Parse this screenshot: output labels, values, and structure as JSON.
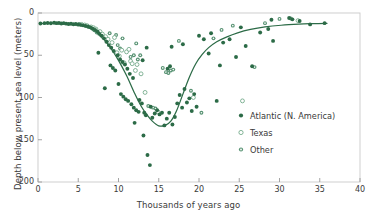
{
  "chart_data": {
    "type": "scatter",
    "title": "",
    "xlabel": "Thousands of years ago",
    "ylabel": "Depth below present sea level (meters)",
    "xlim": [
      0,
      40
    ],
    "ylim": [
      200,
      0
    ],
    "y_inverted": true,
    "grid": false,
    "legend_position": "center-right",
    "xticks": [
      0,
      5,
      10,
      15,
      20,
      25,
      30,
      35,
      40
    ],
    "xtick_labels": [
      "0",
      "5",
      "10",
      "15",
      "20",
      "25",
      "30",
      "35",
      "40"
    ],
    "yticks": [
      0,
      50,
      100,
      150,
      200
    ],
    "ytick_labels": [
      "0",
      "50",
      "100",
      "150",
      "200"
    ],
    "series": [
      {
        "name": "Atlantic (N. America)",
        "marker": "filled-circle",
        "color": "#2c6b47",
        "points": [
          [
            0.3,
            12.5
          ],
          [
            0.8,
            12.0
          ],
          [
            1.2,
            11.8
          ],
          [
            1.6,
            12.2
          ],
          [
            2.0,
            11.5
          ],
          [
            2.3,
            12.0
          ],
          [
            2.6,
            11.8
          ],
          [
            2.9,
            12.4
          ],
          [
            3.2,
            12.0
          ],
          [
            3.5,
            12.6
          ],
          [
            3.8,
            13.0
          ],
          [
            4.1,
            12.8
          ],
          [
            4.4,
            13.4
          ],
          [
            4.7,
            13.0
          ],
          [
            5.0,
            13.8
          ],
          [
            5.3,
            14.0
          ],
          [
            5.6,
            14.6
          ],
          [
            5.9,
            15.2
          ],
          [
            6.2,
            16.0
          ],
          [
            6.5,
            17.0
          ],
          [
            6.8,
            18.5
          ],
          [
            7.1,
            20.0
          ],
          [
            7.4,
            22.0
          ],
          [
            7.6,
            24.5
          ],
          [
            7.9,
            27.0
          ],
          [
            7.5,
            47.0
          ],
          [
            8.2,
            30.0
          ],
          [
            8.5,
            34.0
          ],
          [
            8.3,
            89.0
          ],
          [
            8.8,
            38.0
          ],
          [
            9.1,
            41.0
          ],
          [
            9.4,
            45.0
          ],
          [
            9.0,
            62.0
          ],
          [
            9.3,
            65.0
          ],
          [
            9.6,
            68.0
          ],
          [
            9.9,
            50.0
          ],
          [
            10.2,
            55.0
          ],
          [
            10.5,
            58.0
          ],
          [
            10.0,
            84.0
          ],
          [
            10.3,
            96.0
          ],
          [
            10.6,
            99.0
          ],
          [
            10.9,
            102.0
          ],
          [
            11.2,
            104.0
          ],
          [
            10.8,
            61.0
          ],
          [
            11.1,
            66.0
          ],
          [
            11.4,
            72.0
          ],
          [
            11.6,
            108.0
          ],
          [
            11.9,
            112.0
          ],
          [
            12.2,
            115.0
          ],
          [
            12.5,
            117.0
          ],
          [
            11.8,
            77.0
          ],
          [
            12.0,
            130.0
          ],
          [
            12.6,
            103.0
          ],
          [
            12.9,
            107.0
          ],
          [
            13.2,
            118.0
          ],
          [
            13.4,
            121.0
          ],
          [
            13.1,
            145.0
          ],
          [
            13.6,
            168.0
          ],
          [
            13.9,
            180.0
          ],
          [
            13.0,
            56.0
          ],
          [
            13.5,
            41.0
          ],
          [
            14.2,
            124.0
          ],
          [
            14.5,
            119.0
          ],
          [
            14.8,
            115.0
          ],
          [
            15.1,
            120.0
          ],
          [
            15.4,
            118.0
          ],
          [
            14.0,
            111.0
          ],
          [
            15.7,
            133.0
          ],
          [
            16.0,
            125.0
          ],
          [
            16.3,
            118.0
          ],
          [
            16.1,
            66.0
          ],
          [
            16.4,
            63.0
          ],
          [
            16.7,
            132.0
          ],
          [
            17.0,
            123.0
          ],
          [
            16.6,
            40.0
          ],
          [
            17.3,
            107.0
          ],
          [
            17.6,
            97.0
          ],
          [
            17.9,
            112.0
          ],
          [
            18.2,
            90.0
          ],
          [
            18.5,
            106.0
          ],
          [
            18.0,
            37.0
          ],
          [
            18.8,
            101.0
          ],
          [
            19.1,
            116.0
          ],
          [
            19.4,
            96.0
          ],
          [
            19.7,
            111.0
          ],
          [
            20.0,
            27.0
          ],
          [
            20.6,
            31.0
          ],
          [
            21.2,
            48.0
          ],
          [
            21.5,
            24.0
          ],
          [
            22.2,
            104.0
          ],
          [
            22.6,
            62.0
          ],
          [
            23.0,
            35.0
          ],
          [
            23.8,
            31.0
          ],
          [
            24.6,
            52.0
          ],
          [
            25.2,
            17.0
          ],
          [
            25.8,
            39.0
          ],
          [
            26.6,
            63.0
          ],
          [
            27.6,
            23.0
          ],
          [
            28.6,
            19.0
          ],
          [
            29.2,
            33.0
          ],
          [
            29.0,
            8.0
          ],
          [
            31.2,
            6.0
          ],
          [
            31.6,
            7.5
          ],
          [
            32.5,
            9.5
          ],
          [
            33.8,
            13.5
          ],
          [
            35.6,
            12.0
          ]
        ]
      },
      {
        "name": "Texas",
        "marker": "open-circle",
        "color": "#6fa886",
        "points": [
          [
            5.4,
            13.5
          ],
          [
            5.8,
            14.2
          ],
          [
            6.1,
            15.0
          ],
          [
            6.6,
            16.5
          ],
          [
            6.9,
            17.5
          ],
          [
            7.2,
            19.0
          ],
          [
            7.7,
            22.0
          ],
          [
            8.0,
            25.0
          ],
          [
            8.4,
            28.0
          ],
          [
            8.7,
            31.0
          ],
          [
            9.2,
            35.0
          ],
          [
            9.5,
            29.0
          ],
          [
            9.8,
            47.0
          ],
          [
            10.1,
            51.0
          ],
          [
            10.4,
            44.0
          ],
          [
            10.7,
            59.0
          ],
          [
            11.0,
            46.0
          ],
          [
            11.3,
            43.0
          ],
          [
            11.5,
            57.0
          ],
          [
            11.7,
            60.0
          ],
          [
            12.1,
            68.0
          ],
          [
            12.3,
            61.0
          ],
          [
            12.8,
            72.0
          ],
          [
            13.3,
            94.0
          ],
          [
            14.9,
            117.0
          ],
          [
            19.3,
            100.0
          ],
          [
            25.4,
            104.0
          ],
          [
            32.3,
            9.0
          ]
        ]
      },
      {
        "name": "Other",
        "marker": "dotted-circle",
        "color": "#4e8c6a",
        "points": [
          [
            5.1,
            13.0
          ],
          [
            5.5,
            13.8
          ],
          [
            6.0,
            15.5
          ],
          [
            6.3,
            16.2
          ],
          [
            6.7,
            18.0
          ],
          [
            7.0,
            20.5
          ],
          [
            7.3,
            23.0
          ],
          [
            7.8,
            26.0
          ],
          [
            8.1,
            29.0
          ],
          [
            8.6,
            33.0
          ],
          [
            8.9,
            24.0
          ],
          [
            9.7,
            26.0
          ],
          [
            10.5,
            30.0
          ],
          [
            9.9,
            38.0
          ],
          [
            10.2,
            42.0
          ],
          [
            11.5,
            52.0
          ],
          [
            11.9,
            50.0
          ],
          [
            12.4,
            55.0
          ],
          [
            12.7,
            50.0
          ],
          [
            12.2,
            36.0
          ],
          [
            13.7,
            110.0
          ],
          [
            14.3,
            112.0
          ],
          [
            14.6,
            113.0
          ],
          [
            15.9,
            70.0
          ],
          [
            16.2,
            71.0
          ],
          [
            16.5,
            68.0
          ],
          [
            15.5,
            65.0
          ],
          [
            16.8,
            67.0
          ],
          [
            17.5,
            33.0
          ],
          [
            19.0,
            92.0
          ],
          [
            20.3,
            118.0
          ],
          [
            21.8,
            30.0
          ],
          [
            22.8,
            20.0
          ],
          [
            24.2,
            15.0
          ],
          [
            26.9,
            64.0
          ],
          [
            28.2,
            12.0
          ],
          [
            31.4,
            6.5
          ],
          [
            30.0,
            7.0
          ]
        ]
      }
    ],
    "fit_curve": {
      "name": "sea-level-fit",
      "color": "#2c6b47",
      "points": [
        [
          0.2,
          12.5
        ],
        [
          1.0,
          12.2
        ],
        [
          2.0,
          12.0
        ],
        [
          3.0,
          12.3
        ],
        [
          4.0,
          13.0
        ],
        [
          5.0,
          14.2
        ],
        [
          6.0,
          16.5
        ],
        [
          7.0,
          21.0
        ],
        [
          8.0,
          29.0
        ],
        [
          9.0,
          41.0
        ],
        [
          10.0,
          56.0
        ],
        [
          11.0,
          74.0
        ],
        [
          12.0,
          95.0
        ],
        [
          12.8,
          110.0
        ],
        [
          13.5,
          120.0
        ],
        [
          14.2,
          128.0
        ],
        [
          15.0,
          133.5
        ],
        [
          15.8,
          133.0
        ],
        [
          16.5,
          128.0
        ],
        [
          17.2,
          116.0
        ],
        [
          18.0,
          96.0
        ],
        [
          18.8,
          76.0
        ],
        [
          19.6,
          60.0
        ],
        [
          20.4,
          49.0
        ],
        [
          21.2,
          41.0
        ],
        [
          22.2,
          34.0
        ],
        [
          23.4,
          28.5
        ],
        [
          24.8,
          23.5
        ],
        [
          26.4,
          19.5
        ],
        [
          28.2,
          16.5
        ],
        [
          30.2,
          14.5
        ],
        [
          32.4,
          13.2
        ],
        [
          34.2,
          12.6
        ],
        [
          35.9,
          12.2
        ]
      ]
    }
  },
  "legend": {
    "items": [
      {
        "label": "Atlantic (N. America)",
        "marker": "filled-circle"
      },
      {
        "label": "Texas",
        "marker": "open-circle"
      },
      {
        "label": "Other",
        "marker": "dotted-circle"
      }
    ]
  },
  "colors": {
    "series_dark": "#2c6b47",
    "series_light": "#6fa886",
    "series_mid": "#4e8c6a",
    "axis": "#b8b8b8",
    "text": "#3a3a3a",
    "background": "#ffffff"
  }
}
